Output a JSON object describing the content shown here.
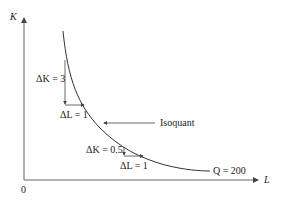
{
  "diagram": {
    "type": "isoquant",
    "axes": {
      "y_label": "K",
      "x_label": "L",
      "origin_label": "0"
    },
    "curve": {
      "name_label": "Isoquant",
      "q_label": "Q = 200"
    },
    "steps": [
      {
        "dk_label": "ΔK = 3",
        "dl_label": "ΔL = 1"
      },
      {
        "dk_label": "ΔK = 0.5",
        "dl_label": "ΔL = 1"
      }
    ],
    "colors": {
      "axis": "#555555",
      "curve": "#333333",
      "text": "#222222"
    }
  }
}
